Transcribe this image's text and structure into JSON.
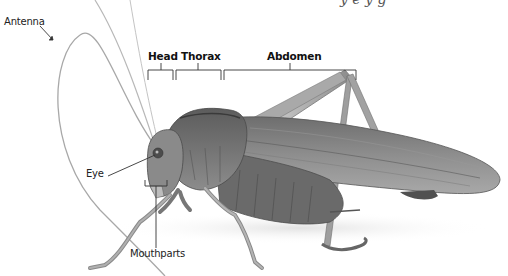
{
  "diagram": {
    "top_caption_cutoff": "y  e    y             g",
    "labels": {
      "antenna": "Antenna",
      "head": "Head",
      "thorax": "Thorax",
      "abdomen": "Abdomen",
      "eye": "Eye",
      "mouthparts": "Mouthparts"
    },
    "colors": {
      "background": "#ffffff",
      "label_text": "#222222",
      "leader_line": "#333333",
      "body_dark": "#5a5a5a",
      "body_mid": "#8a8a8a",
      "body_light": "#b5b5b5",
      "antenna": "#9a9a9a"
    }
  }
}
